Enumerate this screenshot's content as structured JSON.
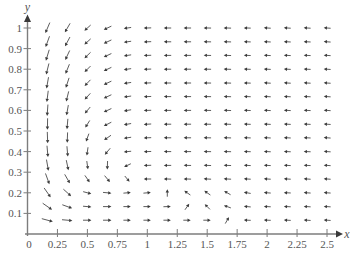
{
  "chart_data": {
    "type": "scatter",
    "plot_kind": "direction_field",
    "title": "",
    "xlabel": "x",
    "ylabel": "y",
    "origin_label": "0",
    "xlim": [
      0,
      2.6
    ],
    "ylim": [
      0,
      1.08
    ],
    "grid": false,
    "legend": null,
    "x_ticks": {
      "values": [
        0.25,
        0.5,
        0.75,
        1,
        1.25,
        1.5,
        1.75,
        2,
        2.25,
        2.5
      ],
      "labels": [
        "0.25",
        "0.5",
        "0.75",
        "1",
        "1.25",
        "1.5",
        "1.75",
        "2",
        "2.25",
        "2.5"
      ]
    },
    "y_ticks": {
      "values": [
        0.1,
        0.2,
        0.3,
        0.4,
        0.5,
        0.6,
        0.7,
        0.8,
        0.9,
        1
      ],
      "labels": [
        "0.1",
        "0.2",
        "0.3",
        "0.4",
        "0.5",
        "0.6",
        "0.7",
        "0.8",
        "0.9",
        "1"
      ]
    },
    "colors": {
      "axis": "#7d7d7d",
      "arrow": "#3a3a3a",
      "text": "#555555"
    },
    "vectors": {
      "description": "Arrow direction angles in degrees (0 = +x, 90 = +y), rows ordered from top (y=1) to bottom (y=0.067), columns left (x=0.167) to right (x=2.5)",
      "x": [
        0.167,
        0.333,
        0.5,
        0.667,
        0.833,
        1.0,
        1.167,
        1.333,
        1.5,
        1.667,
        1.833,
        2.0,
        2.167,
        2.333,
        2.5
      ],
      "y": [
        1.0,
        0.933,
        0.867,
        0.8,
        0.733,
        0.667,
        0.6,
        0.533,
        0.467,
        0.4,
        0.333,
        0.267,
        0.2,
        0.133,
        0.067
      ],
      "relative_length": [
        11,
        10,
        8,
        8,
        7,
        7,
        7,
        7,
        7,
        7,
        6.5,
        6.5,
        6.5,
        6.5,
        6.5
      ],
      "angles_deg": [
        [
          247,
          240,
          222,
          205,
          188,
          182,
          180,
          180,
          179,
          178,
          178,
          177,
          177,
          177,
          176
        ],
        [
          250,
          242,
          222,
          205,
          188,
          182,
          180,
          180,
          179,
          178,
          178,
          177,
          177,
          177,
          176
        ],
        [
          253,
          245,
          224,
          205,
          188,
          182,
          180,
          180,
          179,
          178,
          178,
          177,
          177,
          177,
          176
        ],
        [
          256,
          248,
          225,
          205,
          188,
          182,
          180,
          180,
          179,
          178,
          178,
          177,
          177,
          177,
          176
        ],
        [
          260,
          252,
          226,
          205,
          188,
          182,
          180,
          180,
          179,
          178,
          178,
          177,
          177,
          177,
          176
        ],
        [
          263,
          256,
          228,
          205,
          188,
          182,
          180,
          180,
          179,
          178,
          178,
          177,
          177,
          177,
          176
        ],
        [
          266,
          260,
          230,
          205,
          189,
          182,
          180,
          180,
          179,
          178,
          178,
          177,
          177,
          177,
          176
        ],
        [
          269,
          265,
          238,
          207,
          190,
          183,
          180,
          180,
          179,
          178,
          178,
          177,
          177,
          177,
          176
        ],
        [
          272,
          268,
          250,
          215,
          188,
          182,
          180,
          180,
          179,
          178,
          178,
          177,
          177,
          177,
          176
        ],
        [
          275,
          275,
          262,
          230,
          185,
          182,
          180,
          180,
          179,
          178,
          178,
          177,
          177,
          177,
          176
        ],
        [
          280,
          282,
          278,
          268,
          205,
          182,
          180,
          179,
          178,
          178,
          177,
          177,
          177,
          177,
          176
        ],
        [
          290,
          300,
          305,
          310,
          310,
          180,
          178,
          178,
          177,
          177,
          177,
          177,
          177,
          176,
          176
        ],
        [
          305,
          318,
          345,
          355,
          5,
          5,
          90,
          145,
          145,
          150,
          170,
          176,
          177,
          176,
          176
        ],
        [
          325,
          340,
          355,
          0,
          0,
          0,
          2,
          55,
          135,
          160,
          175,
          177,
          177,
          176,
          176
        ],
        [
          345,
          355,
          0,
          0,
          0,
          0,
          0,
          0,
          0,
          60,
          178,
          178,
          177,
          176,
          176
        ]
      ]
    }
  }
}
